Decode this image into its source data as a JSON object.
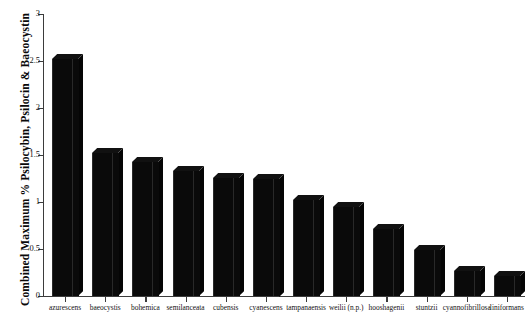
{
  "chart_data": {
    "type": "bar",
    "title": "",
    "subtitle": "",
    "xlabel": "",
    "ylabel": "Combined Maximum % Psilocybin, Psilocin & Baeocystin",
    "ylim": [
      0,
      3
    ],
    "ytick_labels": [
      "0",
      "0.5",
      "1",
      "1.5",
      "2",
      "2.5",
      "3"
    ],
    "ytick_values": [
      0,
      0.5,
      1,
      1.5,
      2,
      2.5,
      3
    ],
    "grid": false,
    "legend": "none",
    "orientation": "vertical",
    "bar_color": "#0a0a0a",
    "style": "3d-extruded",
    "categories": [
      "azurescens",
      "baeocystis",
      "bohemica",
      "semilanceata",
      "cubensis",
      "cyanescens",
      "tampanaensis",
      "weilii (n.p.)",
      "hooshagenii",
      "stuntzii",
      "cyannofibrillosa",
      "liniformans"
    ],
    "values": [
      2.52,
      1.52,
      1.43,
      1.33,
      1.26,
      1.25,
      1.02,
      0.95,
      0.71,
      0.49,
      0.27,
      0.21
    ]
  }
}
